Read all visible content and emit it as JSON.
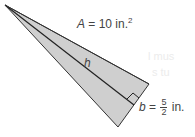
{
  "diagram": {
    "type": "triangle",
    "fill_color": "#cfcfcf",
    "stroke_color": "#333333",
    "area_label": {
      "var": "A",
      "eq": " = 10 in.",
      "sup": "2"
    },
    "height_label": "h",
    "base_label": {
      "var": "b",
      "eq": " = ",
      "num": "5",
      "den": "2",
      "unit": " in."
    }
  },
  "background_text": [
    "l mus",
    "s tu"
  ]
}
